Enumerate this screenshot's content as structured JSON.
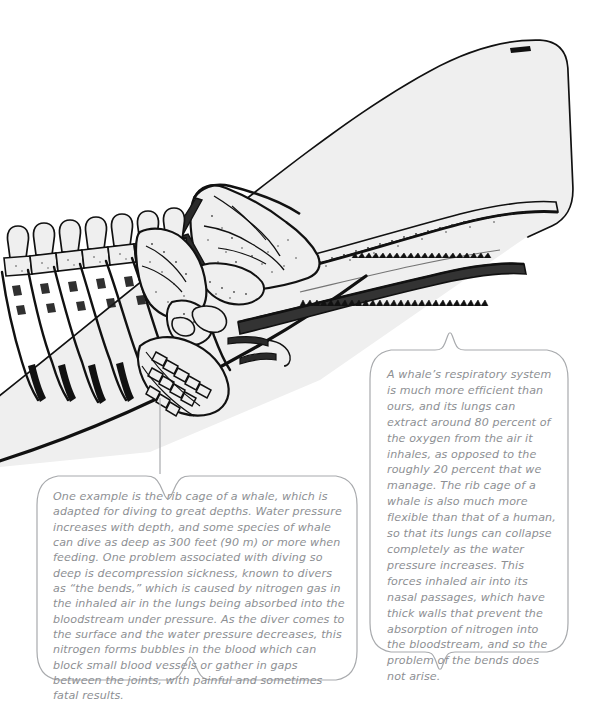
{
  "page": {
    "width": 607,
    "height": 706,
    "background_color": "#ffffff"
  },
  "illustration": {
    "name": "whale-skeleton-anatomical-diagram",
    "subject": "sperm whale head and rib cage with internal skeleton",
    "body_fill_color": "#efefef",
    "outline_color": "#111111",
    "parts": [
      "blowhole",
      "skull",
      "upper-jaw",
      "lower-jaw-with-teeth",
      "cervical-vertebrae",
      "thoracic-vertebrae",
      "ribs",
      "scapula",
      "flipper-bones",
      "hyoid-bones"
    ]
  },
  "callouts": {
    "line_color": "#a8aaad",
    "text_color": "#8d8f93",
    "left": {
      "id": "rib-cage-diving-callout",
      "text": "One example is the rib cage of a whale, which is adapted for diving to great depths. Water pressure increases with depth, and some species of whale can dive as deep as 300 feet (90 m) or more when feeding. One problem associated with diving so deep is decompression sickness, known to divers as “the bends,” which is caused by nitrogen gas in the inhaled air in the lungs being absorbed into the bloodstream under pressure. As the diver comes to the surface and the water pressure decreases, this nitrogen forms bubbles in the blood which can block small blood vessels or gather in gaps between the joints, with painful and sometimes fatal results.",
      "connector": "leader-line-up-to-flipper"
    },
    "right": {
      "id": "respiratory-system-callout",
      "text": "A whale’s respiratory system is much more efficient than ours, and its lungs can extract around 80 percent of the oxygen from the air it inhales, as opposed to the roughly 20 percent that we manage. The rib cage of a whale is also much more flexible than that of a human, so that its lungs can collapse completely as the water pressure increases. This forces inhaled air into its nasal passages, which have thick walls that prevent the absorption of nitrogen into the bloodstream, and so the problem of the bends does not arise.",
      "connector": "notch-pointer-top-and-bottom"
    }
  }
}
